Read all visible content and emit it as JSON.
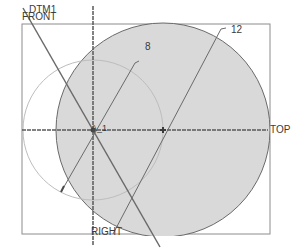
{
  "sketch": {
    "datum_planes": {
      "front": "FRONT",
      "right": "RIGHT",
      "top": "TOP",
      "axis": "DTM1"
    },
    "point_label": "A_1",
    "dimensions": {
      "small_circle_diameter": "8",
      "large_circle_diameter": "12"
    },
    "colors": {
      "fill": "#d9d9d9",
      "geometry": "#5a5a5a",
      "construction": "#b8b8b8",
      "frame": "#8c8c8c",
      "text": "#3a3a3a"
    }
  }
}
